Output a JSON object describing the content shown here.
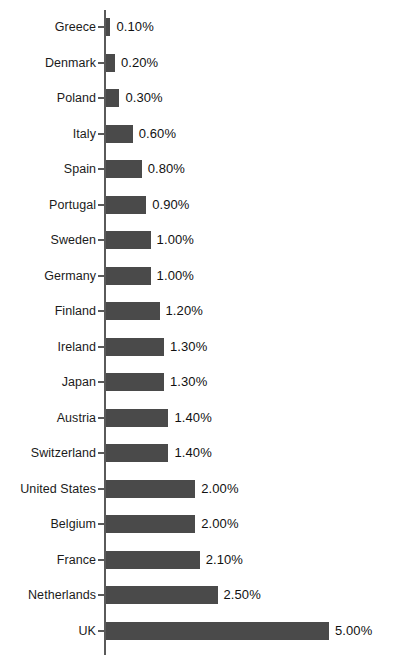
{
  "chart_data": {
    "type": "bar",
    "orientation": "horizontal",
    "title": "",
    "subtitle": "",
    "xlabel": "",
    "ylabel": "",
    "xlim": [
      0,
      5.0
    ],
    "grid": false,
    "legend": false,
    "bar_color": "#4a4a4a",
    "axis_color": "#5a5a5a",
    "background_color": "#ffffff",
    "value_format": "0.00%",
    "categories": [
      "Greece",
      "Denmark",
      "Poland",
      "Italy",
      "Spain",
      "Portugal",
      "Sweden",
      "Germany",
      "Finland",
      "Ireland",
      "Japan",
      "Austria",
      "Switzerland",
      "United States",
      "Belgium",
      "France",
      "Netherlands",
      "UK"
    ],
    "values": [
      0.1,
      0.2,
      0.3,
      0.6,
      0.8,
      0.9,
      1.0,
      1.0,
      1.2,
      1.3,
      1.3,
      1.4,
      1.4,
      2.0,
      2.0,
      2.1,
      2.5,
      5.0
    ],
    "value_labels": [
      "0.10%",
      "0.20%",
      "0.30%",
      "0.60%",
      "0.80%",
      "0.90%",
      "1.00%",
      "1.00%",
      "1.20%",
      "1.30%",
      "1.30%",
      "1.40%",
      "1.40%",
      "2.00%",
      "2.00%",
      "2.10%",
      "2.50%",
      "5.00%"
    ]
  },
  "layout": {
    "row_pitch_px": 35.5,
    "first_row_top_px": 10,
    "axis_x_px": 104,
    "bar_start_x_px": 106,
    "px_per_percent": 44.6,
    "value_label_gap_px": 6
  }
}
